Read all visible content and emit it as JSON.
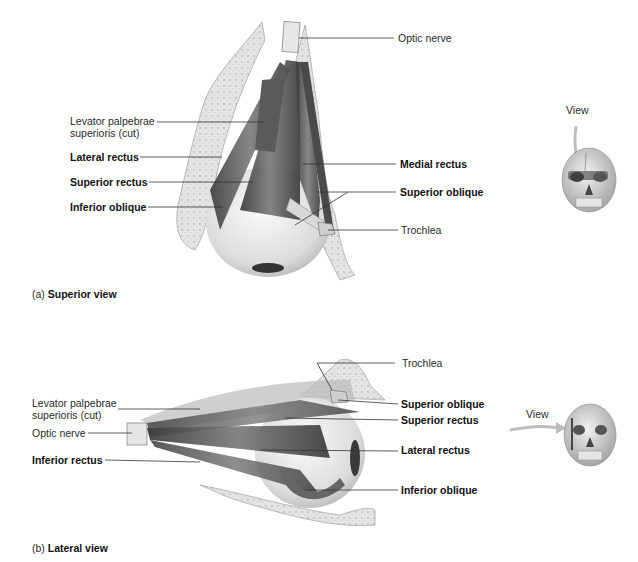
{
  "figure_a": {
    "caption_prefix": "(a)",
    "caption_title": "Superior view",
    "labels_left": [
      {
        "text_line1": "Levator palpebrae",
        "text_line2": "superioris (cut)",
        "bold": false
      },
      {
        "text": "Lateral rectus",
        "bold": true
      },
      {
        "text": "Superior rectus",
        "bold": true
      },
      {
        "text": "Inferior oblique",
        "bold": true
      }
    ],
    "labels_right": [
      {
        "text": "Optic nerve",
        "bold": false
      },
      {
        "text": "Medial rectus",
        "bold": true
      },
      {
        "text": "Superior oblique",
        "bold": true
      },
      {
        "text": "Trochlea",
        "bold": false
      }
    ],
    "orientation_icon": {
      "label": "View",
      "type": "skull-top-arrow"
    }
  },
  "figure_b": {
    "caption_prefix": "(b)",
    "caption_title": "Lateral view",
    "labels_left": [
      {
        "text_line1": "Levator palpebrae",
        "text_line2": "superioris (cut)",
        "bold": false
      },
      {
        "text": "Optic nerve",
        "bold": false
      },
      {
        "text": "Inferior rectus",
        "bold": true
      }
    ],
    "labels_right": [
      {
        "text": "Trochlea",
        "bold": false
      },
      {
        "text": "Superior oblique",
        "bold": true
      },
      {
        "text": "Superior rectus",
        "bold": true
      },
      {
        "text": "Lateral rectus",
        "bold": true
      },
      {
        "text": "Inferior oblique",
        "bold": true
      }
    ],
    "orientation_icon": {
      "label": "View",
      "type": "skull-side-arrow"
    }
  }
}
